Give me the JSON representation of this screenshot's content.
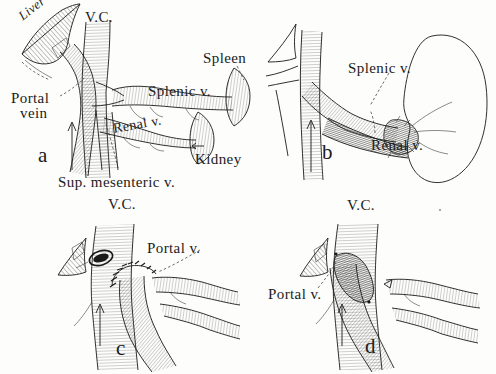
{
  "figure": {
    "style": "pen-and-ink anatomical line engraving, four panels",
    "background_color": "#fdfdfc",
    "ink_color": "#1b1b1b"
  },
  "panels": [
    {
      "id": "a",
      "letter": "a",
      "letter_pos": {
        "x": 38,
        "y": 145
      },
      "description": "Normal anatomy of the portal venous system with vena cava, portal vein, splenic vein, renal vein, superior mesenteric vein, liver, spleen and kidney",
      "labels": [
        {
          "name": "liver",
          "text": "Liver",
          "x": 16,
          "y": 12,
          "size": "sm",
          "italic": true,
          "rotate": -38
        },
        {
          "name": "vena-cava",
          "text": "V.C.",
          "x": 85,
          "y": 10,
          "size": "lg",
          "italic": false,
          "rotate": 0
        },
        {
          "name": "spleen",
          "text": "Spleen",
          "x": 203,
          "y": 51,
          "size": "lg",
          "italic": false,
          "rotate": 0
        },
        {
          "name": "splenic-vein",
          "text": "Splenic v.",
          "x": 148,
          "y": 84,
          "size": "lg",
          "italic": false,
          "rotate": 0
        },
        {
          "name": "portal-vein",
          "text": "Portal",
          "x": 11,
          "y": 91,
          "size": "lg",
          "italic": false,
          "rotate": 0
        },
        {
          "name": "portal-vein-line2",
          "text": "vein",
          "x": 20,
          "y": 106,
          "size": "lg",
          "italic": false,
          "rotate": 0
        },
        {
          "name": "renal-vein",
          "text": "Renal v.",
          "x": 112,
          "y": 122,
          "size": "md",
          "italic": false,
          "rotate": -10
        },
        {
          "name": "kidney",
          "text": "Kidney",
          "x": 195,
          "y": 152,
          "size": "lg",
          "italic": false,
          "rotate": 0
        },
        {
          "name": "sup-mesenteric-vein",
          "text": "Sup. mesenteric  v.",
          "x": 58,
          "y": 175,
          "size": "lg",
          "italic": false,
          "rotate": 0
        }
      ]
    },
    {
      "id": "b",
      "letter": "b",
      "letter_pos": {
        "x": 322,
        "y": 142
      },
      "description": "Splenorenal shunt: splenic vein anastomosed end-to-side to the left renal vein at the kidney hilum",
      "labels": [
        {
          "name": "splenic-vein",
          "text": "Splenic v.",
          "x": 348,
          "y": 61,
          "size": "lg",
          "italic": false,
          "rotate": 0
        },
        {
          "name": "renal-vein",
          "text": "Renal v.",
          "x": 371,
          "y": 138,
          "size": "lg",
          "italic": false,
          "rotate": 0
        }
      ]
    },
    {
      "id": "c",
      "letter": "c",
      "letter_pos": {
        "x": 116,
        "y": 338
      },
      "description": "End-to-side portacaval anastomosis: divided portal vein sutured to the side of the vena cava, with the hepatic stump ligated",
      "labels": [
        {
          "name": "vena-cava",
          "text": "V.C.",
          "x": 108,
          "y": 197,
          "size": "lg",
          "italic": false,
          "rotate": 0
        },
        {
          "name": "portal-vein",
          "text": "Portal v.",
          "x": 147,
          "y": 241,
          "size": "lg",
          "italic": false,
          "rotate": 0
        }
      ]
    },
    {
      "id": "d",
      "letter": "d",
      "letter_pos": {
        "x": 365,
        "y": 336
      },
      "description": "Side-to-side portacaval anastomosis: portal vein joined along its side to the vena cava",
      "labels": [
        {
          "name": "vena-cava",
          "text": "V.C.",
          "x": 347,
          "y": 198,
          "size": "lg",
          "italic": false,
          "rotate": 0
        },
        {
          "name": "portal-vein",
          "text": "Portal v.",
          "x": 268,
          "y": 287,
          "size": "lg",
          "italic": false,
          "rotate": 0
        }
      ]
    }
  ]
}
